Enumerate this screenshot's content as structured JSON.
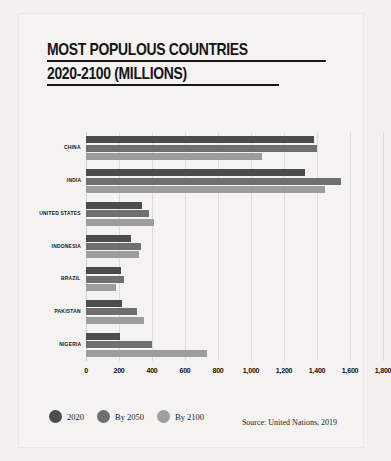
{
  "chart_data": {
    "type": "bar",
    "orientation": "horizontal",
    "title": "MOST POPULOUS COUNTRIES 2020-2100 (MILLIONS)",
    "title_lines": [
      "MOST POPULOUS COUNTRIES",
      "2020-2100 (MILLIONS)"
    ],
    "xlabel": "",
    "ylabel": "",
    "xlim": [
      0,
      1800
    ],
    "grid": true,
    "legend_position": "bottom-left",
    "categories": [
      "CHINA",
      "INDIA",
      "UNITED STATES",
      "INDONESIA",
      "BRAZIL",
      "PAKISTAN",
      "NIGERIA"
    ],
    "xticks": [
      0,
      200,
      400,
      600,
      800,
      1000,
      1200,
      1400,
      1600,
      1800
    ],
    "xticklabels": [
      "0",
      "200",
      "400",
      "600",
      "800",
      "1,000",
      "1,200",
      "1,400",
      "1,600",
      "1,800"
    ],
    "series": [
      {
        "name": "2020",
        "color": "#4c4c4c",
        "values": [
          1382,
          1327,
          340,
          273,
          213,
          220,
          206
        ]
      },
      {
        "name": "By 2050",
        "color": "#6f6f6f",
        "values": [
          1402,
          1545,
          379,
          331,
          229,
          310,
          401
        ]
      },
      {
        "name": "By 2100",
        "color": "#9d9d9d",
        "values": [
          1065,
          1450,
          410,
          321,
          181,
          350,
          733
        ]
      }
    ],
    "annotations": {
      "source": "Source: United Nations, 2019"
    }
  },
  "legend": {
    "items": [
      {
        "label": "2020",
        "color": "#4c4c4c"
      },
      {
        "label": "By 2050",
        "color": "#6f6f6f"
      },
      {
        "label": "By 2100",
        "color": "#9d9d9d"
      }
    ]
  }
}
